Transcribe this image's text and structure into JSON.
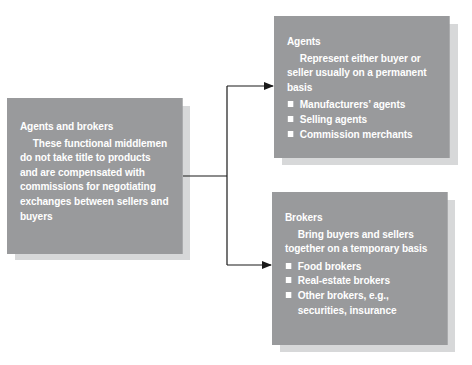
{
  "diagram": {
    "root": {
      "title": "Agents and brokers",
      "description": "These functional middlemen do not take title to products and are compensated with commissions for negotiating exchanges between sellers and buyers"
    },
    "children": [
      {
        "title": "Agents",
        "description": "Represent either buyer or seller usually on a permanent basis",
        "items": [
          "Manufacturers’ agents",
          "Selling agents",
          "Commission merchants"
        ]
      },
      {
        "title": "Brokers",
        "description": "Bring buyers and sellers together on a temporary basis",
        "items": [
          "Food brokers",
          "Real-estate brokers",
          "Other brokers, e.g., securities, insurance"
        ]
      }
    ],
    "colors": {
      "box": "#999a9c",
      "shadow": "#d7d8d9",
      "text": "#ffffff",
      "connector": "#1a1a1a"
    }
  }
}
